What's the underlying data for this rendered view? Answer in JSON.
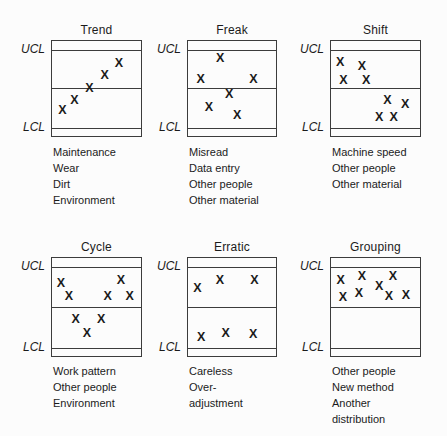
{
  "figure": {
    "marker_glyph": "X",
    "ucl_label": "UCL",
    "lcl_label": "LCL",
    "colors": {
      "line": "#3c3c3c",
      "text": "#1b1b1b",
      "background": "#fcfcfc"
    }
  },
  "panels": [
    {
      "title": "Trend",
      "causes": [
        "Maintenance",
        "Wear",
        "Dirt",
        "Environment"
      ],
      "points": [
        [
          11.8,
          72.9
        ],
        [
          25.3,
          62.6
        ],
        [
          42.1,
          49.8
        ],
        [
          59.3,
          36.1
        ],
        [
          75.1,
          23.4
        ]
      ]
    },
    {
      "title": "Freak",
      "causes": [
        "Misread",
        "Data entry",
        "Other people",
        "Other material"
      ],
      "points": [
        [
          36.7,
          17.8
        ],
        [
          14.4,
          40.2
        ],
        [
          74.4,
          40.2
        ],
        [
          46.7,
          56.0
        ],
        [
          23.7,
          69.8
        ],
        [
          55.9,
          78.0
        ]
      ]
    },
    {
      "title": "Shift",
      "causes": [
        "Machine speed",
        "Other people",
        "Other material"
      ],
      "points": [
        [
          10.2,
          21.6
        ],
        [
          34.8,
          26.8
        ],
        [
          14.0,
          41.2
        ],
        [
          39.6,
          41.2
        ],
        [
          63.4,
          61.9
        ],
        [
          83.2,
          66.0
        ],
        [
          54.2,
          80.1
        ],
        [
          70.3,
          80.1
        ]
      ]
    },
    {
      "title": "Cycle",
      "causes": [
        "Work pattern",
        "Other people",
        "Environment"
      ],
      "points": [
        [
          10.0,
          25.3
        ],
        [
          77.4,
          22.0
        ],
        [
          18.9,
          38.7
        ],
        [
          62.6,
          38.7
        ],
        [
          87.4,
          38.7
        ],
        [
          26.7,
          62.3
        ],
        [
          55.2,
          62.3
        ],
        [
          39.2,
          76.3
        ]
      ]
    },
    {
      "title": "Erratic",
      "causes": [
        "Careless",
        "Over-",
        "adjustment"
      ],
      "points": [
        [
          10.7,
          30.3
        ],
        [
          36.3,
          22.0
        ],
        [
          75.5,
          22.0
        ],
        [
          15.1,
          80.3
        ],
        [
          42.9,
          76.3
        ],
        [
          74.0,
          78.0
        ]
      ]
    },
    {
      "title": "Grouping",
      "causes": [
        "Other people",
        "New method",
        "Another",
        "distribution"
      ],
      "points": [
        [
          11.0,
          22.3
        ],
        [
          34.8,
          18.0
        ],
        [
          69.6,
          18.7
        ],
        [
          54.2,
          28.5
        ],
        [
          13.5,
          39.7
        ],
        [
          31.5,
          36.0
        ],
        [
          65.2,
          38.7
        ],
        [
          84.3,
          38.0
        ]
      ]
    }
  ]
}
